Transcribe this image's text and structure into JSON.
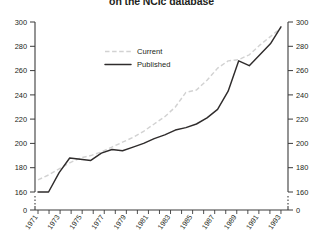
{
  "chart": {
    "title": "on the NCIc database",
    "legend": {
      "position": "top-left-inner",
      "entries": [
        {
          "label": "Current",
          "style": "dashed",
          "color": "#d2d2d2"
        },
        {
          "label": "Published",
          "style": "solid",
          "color": "#2f2c2c"
        }
      ]
    }
  },
  "chart_data": {
    "type": "line",
    "title": "on the NCIc database",
    "xlabel": "",
    "ylabel": "",
    "grid": false,
    "legend_position": "top-left-inner",
    "axis_break": true,
    "axis_break_note": "y-axis broken between 0 and 160",
    "ylim": [
      160,
      300
    ],
    "y_ticks": [
      160,
      180,
      200,
      220,
      240,
      260,
      280,
      300
    ],
    "y_zero_tick": 0,
    "dual_axis": true,
    "right_y_ticks": [
      160,
      180,
      200,
      220,
      240,
      260,
      280,
      300
    ],
    "x": [
      1971,
      1972,
      1973,
      1974,
      1975,
      1976,
      1977,
      1978,
      1979,
      1980,
      1981,
      1982,
      1983,
      1984,
      1985,
      1986,
      1987,
      1988,
      1989,
      1990,
      1991,
      1992,
      1993,
      1994
    ],
    "x_tick_labels": [
      "1971",
      "1973",
      "1975",
      "1977",
      "1979",
      "1981",
      "1983",
      "1985",
      "1987",
      "1989",
      "1991",
      "1993"
    ],
    "series": [
      {
        "name": "Current",
        "style": "dashed",
        "color": "#d2d2d2",
        "values": [
          170,
          174,
          179,
          184,
          188,
          190,
          193,
          197,
          201,
          205,
          210,
          216,
          222,
          230,
          242,
          244,
          252,
          262,
          268,
          269,
          273,
          281,
          288,
          295
        ]
      },
      {
        "name": "Published",
        "style": "solid",
        "color": "#2f2c2c",
        "values": [
          160,
          160,
          176,
          188,
          187,
          186,
          192,
          195,
          194,
          197,
          200,
          204,
          207,
          211,
          213,
          216,
          221,
          228,
          243,
          268,
          264,
          273,
          282,
          296
        ]
      }
    ]
  }
}
